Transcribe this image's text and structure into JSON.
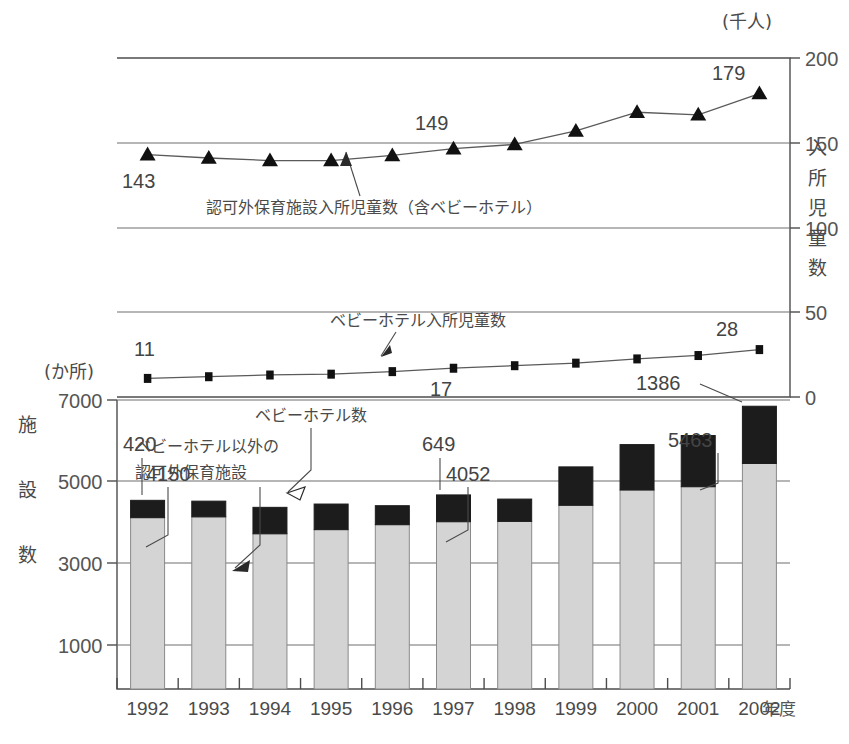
{
  "chart_data": {
    "type": "bar",
    "title": "",
    "subtitle": "",
    "categories": [
      "1992",
      "1993",
      "1994",
      "1995",
      "1996",
      "1997",
      "1998",
      "1999",
      "2000",
      "2001",
      "2002"
    ],
    "xlabel": "年度",
    "axes": {
      "left": {
        "name": "施設数",
        "unit": "(か所)",
        "ticks": [
          "1000",
          "3000",
          "5000",
          "7000"
        ],
        "tickvals": [
          1000,
          3000,
          5000,
          7000
        ],
        "lim": [
          0,
          7000
        ]
      },
      "right": {
        "name": "入所児童数",
        "unit": "(千人)",
        "ticks": [
          "0",
          "50",
          "100",
          "150",
          "200"
        ],
        "tickvals": [
          0,
          50,
          100,
          150,
          200
        ],
        "lim": [
          0,
          200
        ]
      }
    },
    "grid": "horizontal",
    "legend_position": "inline-annotations",
    "series": [
      {
        "name": "ベビーホテル以外の認可外保育施設",
        "kind": "bar-segment-lower",
        "axis": "left",
        "color": "#d4d4d4",
        "values": [
          4150,
          4170,
          3760,
          3860,
          3980,
          4052,
          4060,
          4450,
          4820,
          4900,
          5463
        ],
        "labeled_points": [
          {
            "category": "1992",
            "value": 4150,
            "label": "4150"
          },
          {
            "category": "1997",
            "value": 4052,
            "label": "4052"
          },
          {
            "category": "2002",
            "value": 5463,
            "label": "5463"
          }
        ]
      },
      {
        "name": "ベビーホテル数",
        "kind": "bar-segment-upper",
        "axis": "left",
        "color": "#1c1c1c",
        "values": [
          420,
          380,
          640,
          620,
          460,
          649,
          540,
          930,
          1100,
          1240,
          1386
        ],
        "labeled_points": [
          {
            "category": "1992",
            "value": 420,
            "label": "420"
          },
          {
            "category": "1997",
            "value": 649,
            "label": "649"
          },
          {
            "category": "2002",
            "value": 1386,
            "label": "1386"
          }
        ]
      },
      {
        "name": "認可外保育施設入所児童数（含ベビーホテル）",
        "kind": "line",
        "marker": "triangle",
        "axis": "right",
        "color": "#111111",
        "values": [
          143,
          141,
          139.5,
          139.5,
          142.5,
          146.5,
          149,
          157,
          168,
          166.5,
          179
        ],
        "labeled_points": [
          {
            "category": "1992",
            "value": 143,
            "label": "143"
          },
          {
            "category": "1998",
            "value": 149,
            "label": "149"
          },
          {
            "category": "2002",
            "value": 179,
            "label": "179"
          }
        ]
      },
      {
        "name": "ベビーホテル入所児童数",
        "kind": "line",
        "marker": "square",
        "axis": "right",
        "color": "#111111",
        "values": [
          11,
          12,
          13,
          13.5,
          15,
          17,
          18.5,
          20,
          22.5,
          24.5,
          28
        ],
        "labeled_points": [
          {
            "category": "1992",
            "value": 11,
            "label": "11"
          },
          {
            "category": "1997",
            "value": 17,
            "label": "17"
          },
          {
            "category": "2002",
            "value": 28,
            "label": "28"
          }
        ]
      }
    ],
    "annotations": [
      {
        "id": "annot-ninkagai-jidou",
        "text": "認可外保育施設入所児童数（含ベビーホテル）"
      },
      {
        "id": "annot-babyhotel-jidou",
        "text": "ベビーホテル入所児童数"
      },
      {
        "id": "annot-babyhotel-suu",
        "text": "ベビーホテル数"
      },
      {
        "id": "annot-ninkagai-shisetsu-l1",
        "text": "ベビーホテル以外の"
      },
      {
        "id": "annot-ninkagai-shisetsu-l2",
        "text": "認可外保育施設"
      }
    ]
  },
  "labels": {
    "unit_top_right": "(千人)",
    "unit_mid_left": "(か所)",
    "left_axis_chars": [
      "施",
      "設",
      "数"
    ],
    "right_axis_chars": [
      "入",
      "所",
      "児",
      "童",
      "数"
    ],
    "x_axis_suffix": "年度"
  },
  "colors": {
    "bar_lower": "#d4d4d4",
    "bar_upper": "#1c1c1c",
    "line": "#5a5a5a",
    "marker": "#111111",
    "axis": "#4d4d4d",
    "grid": "#6f6f6f",
    "text": "#4a4a4a",
    "background": "#ffffff"
  }
}
